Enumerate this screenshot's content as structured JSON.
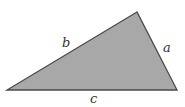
{
  "diagram": {
    "type": "triangle",
    "fill_color": "#a8a8a8",
    "stroke_color": "#4a4a4a",
    "vertices": {
      "top": [
        137,
        12
      ],
      "left": [
        7,
        90
      ],
      "right": [
        177,
        90
      ]
    },
    "sides": [
      {
        "id": "a",
        "label": "a",
        "description": "right side, from top vertex to bottom-right vertex"
      },
      {
        "id": "b",
        "label": "b",
        "description": "left side, from bottom-left vertex to top vertex"
      },
      {
        "id": "c",
        "label": "c",
        "description": "base, from bottom-left vertex to bottom-right vertex"
      }
    ]
  }
}
